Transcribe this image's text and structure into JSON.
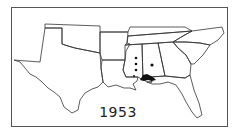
{
  "map": {
    "year_label": "1953",
    "region": "Southeastern United States",
    "marker_color": "#111111",
    "outline_color": "#333333"
  }
}
